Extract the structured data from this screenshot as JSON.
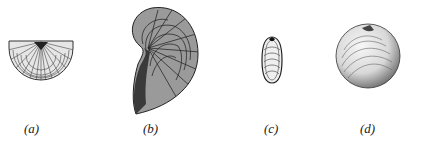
{
  "figure": {
    "panels": [
      {
        "id": "a",
        "label": "(a)",
        "description": "semicircular ribbed bivalve shell"
      },
      {
        "id": "b",
        "label": "(b)",
        "description": "coiled ear-shaped bivalve shell with radial and concentric ribs"
      },
      {
        "id": "c",
        "label": "(c)",
        "description": "elongated oval bivalve shell with concentric growth lines"
      },
      {
        "id": "d",
        "label": "(d)",
        "description": "rounded bivalve shell with concentric growth lines"
      }
    ],
    "colors": {
      "ink": "#1a1a1a",
      "background": "#ffffff"
    }
  }
}
